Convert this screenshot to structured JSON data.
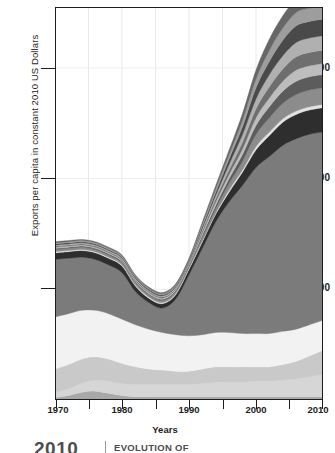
{
  "axes": {
    "ylabel": "Exports per capita in constant 2010 US Dollars",
    "xlabel": "Years",
    "yticks": [
      "100",
      "200",
      "300"
    ],
    "xticks": [
      "1970",
      "1980",
      "1990",
      "2000",
      "2010"
    ]
  },
  "footer": {
    "year": "2010",
    "title": "EVOLUTION OF"
  },
  "chart_data": {
    "type": "area",
    "stacked": true,
    "title": "",
    "xlabel": "Years",
    "ylabel": "Exports per capita in constant 2010 US Dollars",
    "xlim": [
      1970,
      2010
    ],
    "ylim": [
      0,
      355
    ],
    "yticks": [
      100,
      200,
      300
    ],
    "xticks": [
      1970,
      1980,
      1990,
      2000,
      2010
    ],
    "minor_xticks": [
      1975,
      1985,
      1995,
      2005
    ],
    "grid": "vertical-and-horizontal-light",
    "legend": "none",
    "x": [
      1970,
      1972,
      1974,
      1976,
      1978,
      1980,
      1982,
      1984,
      1986,
      1988,
      1990,
      1992,
      1994,
      1996,
      1998,
      2000,
      2002,
      2004,
      2006,
      2008,
      2010
    ],
    "series": [
      {
        "name": "layer-1-bottom-dark",
        "color": "#a8a8a8",
        "values": [
          2,
          4,
          7,
          8,
          6,
          4,
          3,
          3,
          3,
          3,
          3,
          3,
          3,
          3,
          3,
          3,
          3,
          3,
          3,
          3,
          3
        ]
      },
      {
        "name": "layer-2-pale",
        "color": "#d6d6d6",
        "values": [
          5,
          6,
          8,
          10,
          11,
          11,
          11,
          11,
          11,
          11,
          11,
          12,
          13,
          13,
          13,
          14,
          14,
          15,
          16,
          18,
          20
        ]
      },
      {
        "name": "layer-3-light",
        "color": "#c9c9c9",
        "values": [
          21,
          22,
          22,
          21,
          20,
          18,
          16,
          14,
          13,
          12,
          12,
          13,
          14,
          14,
          14,
          13,
          13,
          14,
          16,
          19,
          22
        ]
      },
      {
        "name": "layer-4-white",
        "color": "#f2f2f2",
        "values": [
          47,
          46,
          44,
          42,
          41,
          40,
          38,
          36,
          34,
          33,
          32,
          31,
          31,
          31,
          30,
          30,
          30,
          30,
          29,
          28,
          27
        ]
      },
      {
        "name": "layer-5-dominant-mid-gray",
        "color": "#7b7b7b",
        "values": [
          52,
          50,
          48,
          46,
          44,
          42,
          30,
          24,
          22,
          32,
          55,
          78,
          100,
          118,
          134,
          150,
          160,
          168,
          172,
          172,
          170
        ]
      },
      {
        "name": "layer-6-dark-band",
        "color": "#2e2e2e",
        "values": [
          6,
          6,
          6,
          6,
          6,
          6,
          5,
          4,
          4,
          4,
          5,
          6,
          7,
          9,
          12,
          16,
          19,
          21,
          22,
          22,
          22
        ]
      },
      {
        "name": "layer-7-thin-light",
        "color": "#e2e2e2",
        "values": [
          1,
          1,
          1,
          1,
          1,
          1,
          1,
          1,
          1,
          1,
          1,
          1,
          1,
          2,
          2,
          3,
          3,
          3,
          3,
          3,
          3
        ]
      },
      {
        "name": "layer-8-mid",
        "color": "#8c8c8c",
        "values": [
          2,
          2,
          2,
          2,
          2,
          2,
          2,
          2,
          2,
          2,
          2,
          3,
          4,
          6,
          8,
          11,
          13,
          14,
          15,
          15,
          15
        ]
      },
      {
        "name": "layer-9-darkish",
        "color": "#5c5c5c",
        "values": [
          1,
          1,
          1,
          1,
          1,
          1,
          1,
          1,
          1,
          1,
          1,
          2,
          3,
          4,
          6,
          8,
          10,
          11,
          12,
          12,
          12
        ]
      },
      {
        "name": "layer-10-pale",
        "color": "#bdbdbd",
        "values": [
          1,
          1,
          1,
          1,
          1,
          1,
          1,
          1,
          1,
          1,
          1,
          2,
          3,
          4,
          5,
          7,
          8,
          9,
          10,
          10,
          10
        ]
      },
      {
        "name": "layer-11-mid-dark",
        "color": "#6e6e6e",
        "values": [
          1,
          1,
          1,
          1,
          1,
          1,
          1,
          1,
          1,
          1,
          1,
          2,
          3,
          4,
          6,
          8,
          10,
          11,
          12,
          12,
          12
        ]
      },
      {
        "name": "layer-12-light-gray",
        "color": "#b0b0b0",
        "values": [
          1,
          1,
          1,
          1,
          1,
          1,
          1,
          1,
          1,
          1,
          1,
          2,
          3,
          5,
          7,
          9,
          11,
          12,
          13,
          13,
          13
        ]
      },
      {
        "name": "layer-13-dark-top",
        "color": "#4a4a4a",
        "values": [
          1,
          1,
          1,
          1,
          1,
          1,
          1,
          1,
          1,
          1,
          1,
          2,
          3,
          5,
          7,
          10,
          12,
          14,
          15,
          15,
          15
        ]
      },
      {
        "name": "layer-14-light-top",
        "color": "#9d9d9d",
        "values": [
          1,
          1,
          1,
          1,
          1,
          1,
          1,
          1,
          1,
          1,
          1,
          2,
          3,
          4,
          6,
          8,
          10,
          11,
          12,
          12,
          12
        ]
      },
      {
        "name": "layer-15-topmost",
        "color": "#676767",
        "values": [
          1,
          1,
          1,
          1,
          1,
          1,
          1,
          1,
          1,
          1,
          1,
          2,
          3,
          4,
          6,
          8,
          10,
          11,
          12,
          12,
          12
        ]
      }
    ]
  }
}
